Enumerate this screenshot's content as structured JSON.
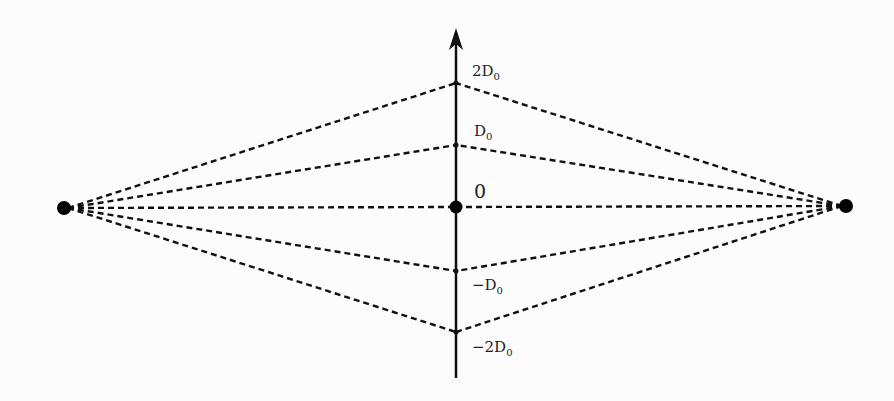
{
  "diagram": {
    "axis": {
      "x": 456,
      "top": 30,
      "bottom": 378,
      "color": "#111111"
    },
    "left_point": {
      "x": 64,
      "y": 208
    },
    "right_point": {
      "x": 846,
      "y": 206
    },
    "levels": [
      {
        "label": "2D",
        "sub": "0",
        "y": 83,
        "label_x": 472,
        "label_y": 76
      },
      {
        "label": "D",
        "sub": "0",
        "y": 145,
        "label_x": 474,
        "label_y": 136
      },
      {
        "label": "0",
        "sub": "",
        "y": 207,
        "label_x": 474,
        "label_y": 198,
        "big": true
      },
      {
        "label": "−D",
        "sub": "0",
        "y": 271,
        "label_x": 472,
        "label_y": 290
      },
      {
        "label": "−2D",
        "sub": "0",
        "y": 332,
        "label_x": 472,
        "label_y": 352
      }
    ],
    "line_style": "dashed",
    "color": "#111111"
  }
}
